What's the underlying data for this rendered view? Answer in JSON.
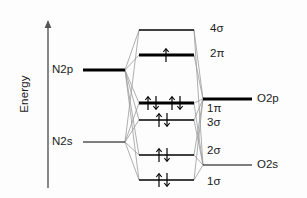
{
  "figure": {
    "type": "molecular-orbital-energy-level-diagram",
    "axis": {
      "label": "Energy",
      "arrow_direction": "up"
    },
    "colors": {
      "level_line": "#000000",
      "correlation_line": "#9a9a9a",
      "text": "#1b1b1b",
      "background": "#fdfdfd"
    },
    "left_atomic_orbitals": [
      {
        "label": "N2p",
        "y": 70,
        "weight": "thick"
      },
      {
        "label": "N2s",
        "y": 142,
        "weight": "thin"
      }
    ],
    "right_atomic_orbitals": [
      {
        "label": "O2p",
        "y": 99,
        "weight": "thick"
      },
      {
        "label": "O2s",
        "y": 165,
        "weight": "thin"
      }
    ],
    "molecular_orbitals": [
      {
        "label": "4σ",
        "y": 30,
        "weight": "thin",
        "electrons": 0
      },
      {
        "label": "2π",
        "y": 55,
        "weight": "thick",
        "electrons": 1
      },
      {
        "label": "1π",
        "y": 103,
        "weight": "thick",
        "electrons": 4
      },
      {
        "label": "3σ",
        "y": 120,
        "weight": "thin",
        "electrons": 2
      },
      {
        "label": "2σ",
        "y": 155,
        "weight": "thin",
        "electrons": 2
      },
      {
        "label": "1σ",
        "y": 180,
        "weight": "thin",
        "electrons": 2
      }
    ]
  }
}
